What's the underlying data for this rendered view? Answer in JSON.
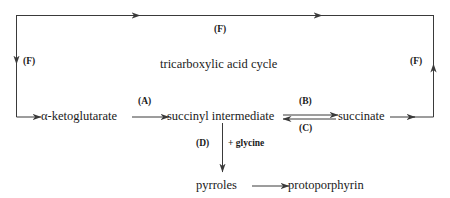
{
  "diagram": {
    "title": "tricarboxylic acid cycle",
    "nodes": [
      {
        "id": "alpha_ketoglutarate",
        "label": "α-ketoglutarate"
      },
      {
        "id": "succinyl_intermediate",
        "label": "succinyl intermediate"
      },
      {
        "id": "succinate",
        "label": "succinate"
      },
      {
        "id": "pyrroles",
        "label": "pyrroles"
      },
      {
        "id": "protoporphyrin",
        "label": "protoporphyrin"
      }
    ],
    "step_labels": {
      "a": "(A)",
      "b": "(B)",
      "c": "(C)",
      "d": "(D)",
      "f_top": "(F)",
      "f_left": "(F)",
      "f_right": "(F)"
    },
    "cofactor": "+ glycine",
    "colors": {
      "stroke": "#3a3a3a",
      "text": "#1a1a1a",
      "background": "#ffffff"
    }
  }
}
